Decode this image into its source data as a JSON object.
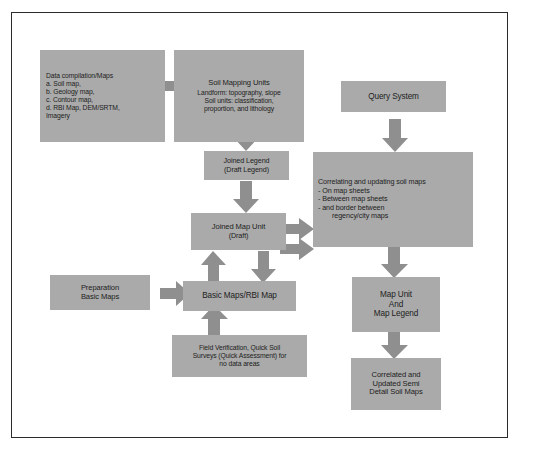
{
  "diagram": {
    "title_visible": false,
    "colors": {
      "box_fill": "#aaaaaa",
      "arrow_fill": "#8f8f8f",
      "frame_border": "#2b2b2b",
      "background": "#ffffff",
      "text": "#1d1d1d"
    },
    "nodes": {
      "data_compilation": {
        "lines": [
          "Data compilation/Maps",
          "a. Soil map,",
          "b. Geology map,",
          "c.  Contour map,",
          "d.  RBI Map, DEM/SRTM,",
          "Imagery"
        ]
      },
      "soil_mapping_units": {
        "lines": [
          "Soil Mapping Units",
          "Landform: topography, slope",
          "Soil units: classification,",
          "proportion, and lithology"
        ]
      },
      "query_system": {
        "lines": [
          "Query System"
        ]
      },
      "joined_legend": {
        "lines": [
          "Joined  Legend",
          "(Draft Legend)"
        ]
      },
      "correlating_updating": {
        "title": "Correlating and updating soil maps",
        "bullets": [
          "-      On map sheets",
          "-      Between map sheets",
          "-      and border between",
          "regency/city maps"
        ]
      },
      "joined_map_unit": {
        "lines": [
          "Joined Map Unit",
          "(Draft)"
        ]
      },
      "preparation_basic_maps": {
        "lines": [
          "Preparation",
          "Basic Maps"
        ]
      },
      "basic_maps_rbi": {
        "lines": [
          "Basic Maps/RBI Map"
        ]
      },
      "field_verification": {
        "lines": [
          "Field Verification,  Quick Soil",
          "Surveys (Quick Assessment) for",
          "no data areas"
        ]
      },
      "map_unit_and_legend": {
        "lines": [
          "Map Unit",
          "And",
          "Map Legend"
        ]
      },
      "correlated_updated_maps": {
        "lines": [
          "Correlated and",
          "Updated Semi",
          "Detail Soil  Maps"
        ]
      }
    },
    "arrows": [
      {
        "name": "data-compilation-to-soil-mapping-units",
        "direction": "right"
      },
      {
        "name": "soil-mapping-units-to-joined-legend",
        "direction": "down"
      },
      {
        "name": "joined-legend-to-joined-map-unit",
        "direction": "down"
      },
      {
        "name": "query-system-to-correlating",
        "direction": "down"
      },
      {
        "name": "joined-map-unit-to-correlating-upper",
        "direction": "right"
      },
      {
        "name": "joined-map-unit-to-correlating-lower",
        "direction": "right"
      },
      {
        "name": "basic-maps-to-joined-map-unit",
        "direction": "up"
      },
      {
        "name": "joined-map-unit-to-basic-maps",
        "direction": "down"
      },
      {
        "name": "preparation-to-basic-maps",
        "direction": "right"
      },
      {
        "name": "field-verification-to-basic-maps",
        "direction": "up"
      },
      {
        "name": "correlating-to-map-unit-legend",
        "direction": "down"
      },
      {
        "name": "map-unit-legend-to-correlated-maps",
        "direction": "down"
      }
    ]
  }
}
